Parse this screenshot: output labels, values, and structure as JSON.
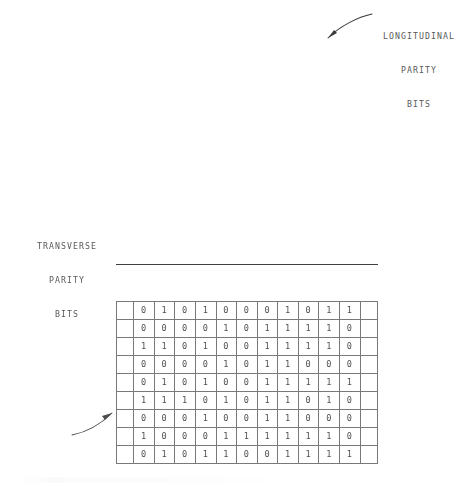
{
  "figure": {
    "ink_color": "#3f3f3f",
    "rule_color": "#6e6e6e",
    "background": "#ffffff"
  },
  "annotations": {
    "longitudinal": {
      "line1": "LONGITUDINAL",
      "line2": "PARITY",
      "line3": "BITS",
      "arrow": "curved-arrow-down-left"
    },
    "transverse": {
      "line1": "TRANSVERSE",
      "line2": "PARITY",
      "line3": "BITS",
      "arrow": "curved-arrow-up-right"
    }
  },
  "chart_data": {
    "type": "table",
    "data_columns": 10,
    "parity_columns": 1,
    "data_rows": 8,
    "parity_rows": 1,
    "rows": [
      {
        "name": "row-1",
        "kind": "data",
        "data": [
          "0",
          "1",
          "0",
          "1",
          "0",
          "0",
          "0",
          "1",
          "0",
          "1"
        ],
        "parity": "1"
      },
      {
        "name": "row-2",
        "kind": "data",
        "data": [
          "0",
          "0",
          "0",
          "0",
          "1",
          "0",
          "1",
          "1",
          "1",
          "1"
        ],
        "parity": "0"
      },
      {
        "name": "row-3",
        "kind": "data",
        "data": [
          "1",
          "1",
          "0",
          "1",
          "0",
          "0",
          "1",
          "1",
          "1",
          "1"
        ],
        "parity": "0"
      },
      {
        "name": "row-4",
        "kind": "data",
        "data": [
          "0",
          "0",
          "0",
          "0",
          "1",
          "0",
          "1",
          "1",
          "0",
          "0"
        ],
        "parity": "0"
      },
      {
        "name": "row-5",
        "kind": "data",
        "data": [
          "0",
          "1",
          "0",
          "1",
          "0",
          "0",
          "1",
          "1",
          "1",
          "1"
        ],
        "parity": "1"
      },
      {
        "name": "row-6",
        "kind": "data",
        "data": [
          "1",
          "1",
          "1",
          "0",
          "1",
          "0",
          "1",
          "1",
          "0",
          "1"
        ],
        "parity": "0"
      },
      {
        "name": "row-7",
        "kind": "data",
        "data": [
          "0",
          "0",
          "0",
          "1",
          "0",
          "0",
          "1",
          "1",
          "0",
          "0"
        ],
        "parity": "0"
      },
      {
        "name": "row-8",
        "kind": "data",
        "data": [
          "1",
          "0",
          "0",
          "0",
          "1",
          "1",
          "1",
          "1",
          "1",
          "1"
        ],
        "parity": "0"
      },
      {
        "name": "row-9",
        "kind": "transverse-parity",
        "data": [
          "0",
          "1",
          "0",
          "1",
          "1",
          "0",
          "0",
          "1",
          "1",
          "1"
        ],
        "parity": "1"
      }
    ]
  }
}
